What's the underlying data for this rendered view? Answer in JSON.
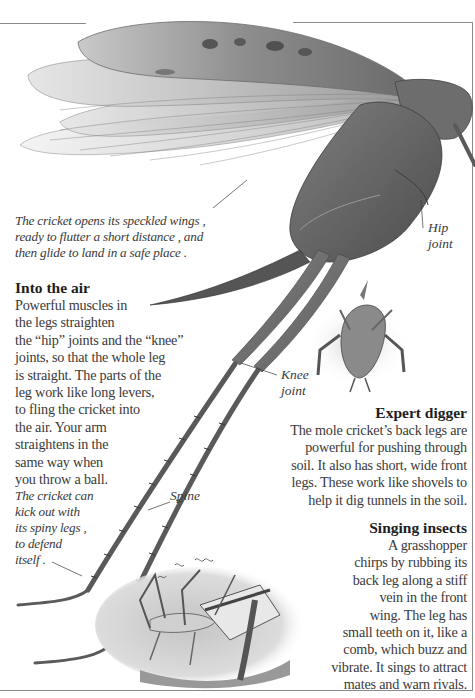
{
  "captions": {
    "wings": [
      "The cricket opens its speckled wings ,",
      "ready to flutter a short distance , and",
      "then glide to land in a safe place ."
    ],
    "defend": [
      "The cricket can",
      "kick out with",
      "its spiny legs ,",
      "to defend",
      "itself ."
    ]
  },
  "labels": {
    "hip": [
      "Hip",
      "joint"
    ],
    "knee": [
      "Knee",
      "joint"
    ],
    "spine": "Spine"
  },
  "sections": {
    "into_the_air": {
      "heading": "Into the air",
      "lines": [
        "Powerful muscles in",
        "the legs straighten",
        "the “hip” joints and the “knee”",
        "joints, so that the whole leg",
        "is straight. The parts of the",
        "leg work like long levers,",
        "to fling the cricket into",
        "the air. Your arm",
        "straightens in the",
        "same way when",
        "you throw a ball."
      ]
    },
    "expert_digger": {
      "heading": "Expert digger",
      "lines": [
        "The mole cricket’s back legs are",
        "powerful for pushing through",
        "soil. It also has short, wide front",
        "legs. These work like shovels to",
        "help it dig tunnels in the soil."
      ]
    },
    "singing_insects": {
      "heading": "Singing insects",
      "lines": [
        "A grasshopper",
        "chirps by rubbing its",
        "back leg along a stiff",
        "vein in the front",
        "wing. The leg has",
        "small teeth on it, like a",
        "comb, which buzz and",
        "vibrate. It sings to attract",
        "mates and warn rivals."
      ]
    }
  },
  "colors": {
    "frame": "#8a8a8a",
    "text": "#3a3a3a",
    "heading": "#1e1e1e"
  }
}
